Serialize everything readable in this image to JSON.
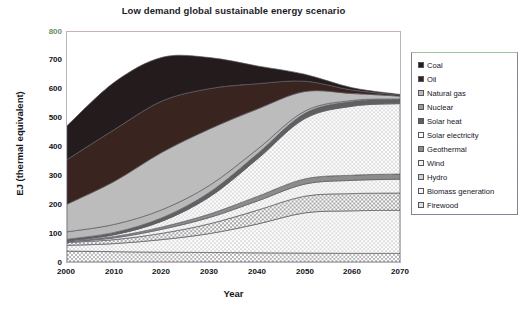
{
  "chart_data": {
    "type": "area",
    "title": "Low demand global sustainable energy scenario",
    "xlabel": "Year",
    "ylabel": "EJ (thermal equivalent)",
    "stacked": true,
    "grid": false,
    "legend_position": "right",
    "xlim": [
      2000,
      2070
    ],
    "ylim": [
      0,
      800
    ],
    "yticks": [
      0,
      100,
      200,
      300,
      400,
      500,
      600,
      700,
      800
    ],
    "ytick_labels": [
      "0",
      "100",
      "200",
      "300",
      "400",
      "500",
      "600",
      "700",
      "800"
    ],
    "xticks": [
      2000,
      2010,
      2020,
      2030,
      2040,
      2050,
      2060,
      2070
    ],
    "xtick_labels": [
      "2000",
      "2010",
      "2020",
      "2030",
      "2040",
      "2050",
      "2060",
      "2070"
    ],
    "x": [
      2000,
      2010,
      2020,
      2030,
      2040,
      2050,
      2060,
      2070
    ],
    "stack_order_bottom_to_top": [
      "Firewood",
      "Biomass generation",
      "Hydro",
      "Wind",
      "Geothermal",
      "Solar electricity",
      "Solar heat",
      "Nuclear",
      "Natural gas",
      "Oil",
      "Coal"
    ],
    "series": [
      {
        "name": "Firewood",
        "color": "#e9e9e9",
        "pattern": "checker-light",
        "values": [
          38,
          36,
          34,
          33,
          32,
          31,
          30,
          30
        ]
      },
      {
        "name": "Biomass generation",
        "color": "#f4f4f4",
        "pattern": "checker-faint",
        "values": [
          20,
          28,
          44,
          66,
          100,
          140,
          148,
          150
        ]
      },
      {
        "name": "Hydro",
        "color": "#dcdcdc",
        "pattern": "checker-mid",
        "values": [
          10,
          14,
          22,
          34,
          48,
          58,
          60,
          60
        ]
      },
      {
        "name": "Wind",
        "color": "#f0f0f0",
        "pattern": "checker-faint",
        "values": [
          2,
          6,
          14,
          22,
          32,
          42,
          46,
          48
        ]
      },
      {
        "name": "Geothermal",
        "color": "#8c8c8c",
        "pattern": "solid-grey",
        "values": [
          3,
          5,
          8,
          12,
          16,
          18,
          18,
          18
        ]
      },
      {
        "name": "Solar electricity",
        "color": "#fafafa",
        "pattern": "checker-faint",
        "values": [
          1,
          6,
          20,
          60,
          130,
          210,
          240,
          245
        ]
      },
      {
        "name": "Solar heat",
        "color": "#606060",
        "pattern": "solid-darkgrey",
        "values": [
          5,
          8,
          12,
          16,
          18,
          18,
          16,
          14
        ]
      },
      {
        "name": "Nuclear",
        "color": "#b8b8b8",
        "pattern": "solid-lightgrey",
        "values": [
          26,
          28,
          28,
          24,
          16,
          8,
          4,
          2
        ]
      },
      {
        "name": "Natural gas",
        "color": "#bcbcbc",
        "pattern": "solid-lightgrey",
        "values": [
          96,
          150,
          200,
          196,
          140,
          68,
          24,
          10
        ]
      },
      {
        "name": "Oil",
        "color": "#3a2420",
        "pattern": "solid-dark",
        "values": [
          155,
          180,
          178,
          140,
          88,
          36,
          12,
          4
        ]
      },
      {
        "name": "Coal",
        "color": "#241c1c",
        "pattern": "solid-darkest",
        "values": [
          118,
          165,
          152,
          108,
          62,
          24,
          8,
          2
        ]
      }
    ],
    "totals": [
      474,
      626,
      712,
      691,
      682,
      653,
      606,
      603
    ],
    "annotations": []
  },
  "legend": {
    "items": [
      {
        "label": "Coal",
        "swatch": "solid-darkest"
      },
      {
        "label": "Oil",
        "swatch": "solid-dark"
      },
      {
        "label": "Natural gas",
        "swatch": "solid-lightgrey"
      },
      {
        "label": "Nuclear",
        "swatch": "solid-lightgrey"
      },
      {
        "label": "Solar heat",
        "swatch": "solid-darkgrey"
      },
      {
        "label": "Solar electricity",
        "swatch": "checker-faint"
      },
      {
        "label": "Geothermal",
        "swatch": "solid-grey"
      },
      {
        "label": "Wind",
        "swatch": "checker-faint"
      },
      {
        "label": "Hydro",
        "swatch": "checker-mid"
      },
      {
        "label": "Biomass generation",
        "swatch": "checker-faint"
      },
      {
        "label": "Firewood",
        "swatch": "checker-light"
      }
    ]
  },
  "colors": {
    "plot_border": "#b9b4c0",
    "legend_border": "#8b7f95",
    "title_text": "#1b1b28",
    "tick_text": "#121220",
    "top_tick_text": "#6a8f6a"
  }
}
